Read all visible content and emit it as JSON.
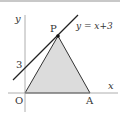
{
  "diagram": {
    "axes": {
      "x_label": "x",
      "y_label": "y",
      "origin_label": "O"
    },
    "points": {
      "P": "P",
      "A": "A"
    },
    "y_tick": "3",
    "line_label": "y = x+3",
    "colors": {
      "fill": "#dcdcdc",
      "line": "#222222",
      "axis": "#999999"
    }
  }
}
